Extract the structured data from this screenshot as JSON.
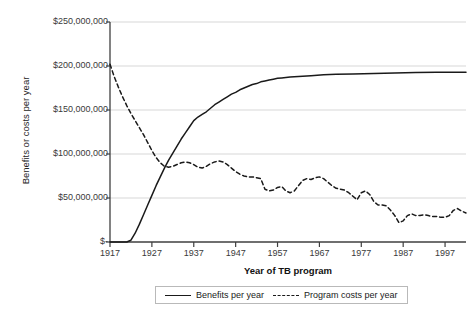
{
  "chart_data": {
    "type": "line",
    "title": "",
    "xlabel": "Year of TB program",
    "ylabel": "Benefits or costs per year",
    "xlim": [
      1917,
      2002
    ],
    "ylim": [
      0,
      250000000
    ],
    "grid": true,
    "legend_position": "bottom",
    "y_tick_labels": [
      "$250,000,000",
      "$200,000,000",
      "$150,000,000",
      "$100,000,000",
      "$50,000,000",
      "$-"
    ],
    "y_tick_values": [
      250000000,
      200000000,
      150000000,
      100000000,
      50000000,
      0
    ],
    "x_tick_labels": [
      "1917",
      "1927",
      "1937",
      "1947",
      "1957",
      "1967",
      "1977",
      "1987",
      "1997"
    ],
    "x_tick_values": [
      1917,
      1927,
      1937,
      1947,
      1957,
      1967,
      1977,
      1987,
      1997
    ],
    "series": [
      {
        "name": "Benefits per year",
        "style": "solid",
        "color": "#1a1a1a",
        "x": [
          1917,
          1918,
          1919,
          1920,
          1921,
          1922,
          1923,
          1924,
          1925,
          1926,
          1927,
          1928,
          1929,
          1930,
          1931,
          1932,
          1933,
          1934,
          1935,
          1936,
          1937,
          1938,
          1939,
          1940,
          1941,
          1942,
          1943,
          1944,
          1945,
          1946,
          1947,
          1948,
          1949,
          1950,
          1951,
          1952,
          1953,
          1954,
          1955,
          1956,
          1957,
          1958,
          1960,
          1962,
          1965,
          1968,
          1971,
          1975,
          1980,
          1985,
          1990,
          1995,
          2000,
          2002
        ],
        "values": [
          0,
          0,
          0,
          0,
          0,
          2000000,
          10000000,
          20000000,
          31000000,
          42000000,
          53000000,
          64000000,
          74000000,
          84000000,
          93000000,
          101000000,
          109000000,
          117000000,
          124000000,
          131000000,
          138000000,
          142000000,
          145000000,
          148000000,
          152000000,
          156000000,
          159000000,
          162000000,
          165000000,
          168000000,
          170000000,
          173000000,
          175000000,
          177000000,
          179000000,
          180000000,
          182000000,
          183000000,
          184000000,
          185000000,
          186000000,
          186500000,
          187500000,
          188000000,
          189000000,
          190000000,
          190500000,
          191000000,
          191500000,
          192000000,
          192500000,
          193000000,
          193000000,
          193000000
        ]
      },
      {
        "name": "Program costs per year",
        "style": "dashed",
        "color": "#1a1a1a",
        "x": [
          1917,
          1918,
          1919,
          1920,
          1921,
          1922,
          1923,
          1924,
          1925,
          1926,
          1927,
          1928,
          1929,
          1930,
          1931,
          1932,
          1933,
          1934,
          1935,
          1936,
          1937,
          1938,
          1939,
          1940,
          1941,
          1942,
          1943,
          1944,
          1945,
          1946,
          1947,
          1948,
          1949,
          1950,
          1951,
          1952,
          1953,
          1954,
          1955,
          1956,
          1957,
          1958,
          1959,
          1960,
          1961,
          1962,
          1963,
          1964,
          1965,
          1966,
          1967,
          1968,
          1969,
          1970,
          1971,
          1972,
          1973,
          1974,
          1975,
          1976,
          1977,
          1978,
          1979,
          1980,
          1981,
          1982,
          1983,
          1984,
          1985,
          1986,
          1987,
          1988,
          1989,
          1990,
          1991,
          1992,
          1993,
          1994,
          1995,
          1996,
          1997,
          1998,
          1999,
          2000,
          2001,
          2002
        ],
        "values": [
          202000000,
          188000000,
          176000000,
          165000000,
          155000000,
          146000000,
          138000000,
          130000000,
          122000000,
          113000000,
          104000000,
          96000000,
          90000000,
          86000000,
          85000000,
          86000000,
          88000000,
          90000000,
          91000000,
          90000000,
          88000000,
          85000000,
          84000000,
          86000000,
          89000000,
          91000000,
          92000000,
          91000000,
          88000000,
          84000000,
          80000000,
          77000000,
          75000000,
          74000000,
          74000000,
          73000000,
          72000000,
          60000000,
          58000000,
          59000000,
          62000000,
          63000000,
          58000000,
          56000000,
          58000000,
          64000000,
          70000000,
          72000000,
          71000000,
          73000000,
          74000000,
          72000000,
          68000000,
          64000000,
          61000000,
          60000000,
          59000000,
          56000000,
          52000000,
          48000000,
          56000000,
          58000000,
          54000000,
          46000000,
          42000000,
          42000000,
          41000000,
          36000000,
          30000000,
          22000000,
          24000000,
          30000000,
          32000000,
          30000000,
          30000000,
          31000000,
          30000000,
          29000000,
          29000000,
          28000000,
          28000000,
          30000000,
          36000000,
          38000000,
          35000000,
          33000000
        ]
      }
    ]
  }
}
